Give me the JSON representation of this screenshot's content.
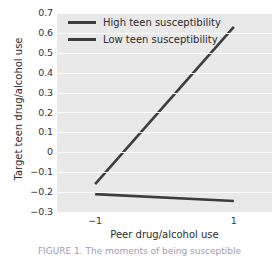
{
  "figure": {
    "caption_partial": "FIGURE 1. The moments of being susceptible"
  },
  "chart_data": {
    "type": "line",
    "title": "",
    "xlabel": "Peer drug/alcohol use",
    "ylabel": "Target teen drug/alcohol use",
    "x": [
      -1,
      1
    ],
    "xlim": [
      -1.55,
      1.55
    ],
    "ylim": [
      -0.3,
      0.7
    ],
    "xticks": [
      -1,
      1
    ],
    "xticklabels": [
      "−1",
      "1"
    ],
    "yticks": [
      0.7,
      0.6,
      0.5,
      0.4,
      0.3,
      0.2,
      0.1,
      0,
      -0.1,
      -0.2,
      -0.3
    ],
    "yticklabels": [
      "0.7",
      "0.6",
      "0.5",
      "0.4",
      "0.3",
      "0.2",
      "0.1",
      "0",
      "−0.1",
      "−0.2",
      "−0.3"
    ],
    "grid": "horizontal-white-on-gray",
    "legend_position": "upper-left-inside",
    "series": [
      {
        "name": "High teen susceptibility",
        "values": [
          -0.16,
          0.63
        ],
        "color": "#3d3d3d"
      },
      {
        "name": "Low teen susceptibility",
        "values": [
          -0.21,
          -0.245
        ],
        "color": "#3d3d3d"
      }
    ]
  },
  "legend": {
    "items": [
      {
        "label": "High teen susceptibility"
      },
      {
        "label": "Low teen susceptibility"
      }
    ]
  }
}
